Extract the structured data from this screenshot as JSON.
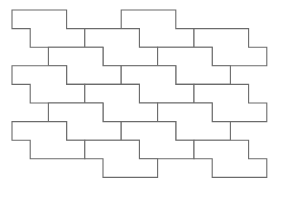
{
  "diagram": {
    "type": "polyomino-tiling",
    "colors": {
      "background": "#ffffff",
      "stroke": "#6b6b6b"
    },
    "grid": {
      "origin_x": 12,
      "origin_y": 10,
      "step_x": 18.2,
      "step_y": 18.6
    },
    "tile_shape_cells": [
      [
        0,
        0
      ],
      [
        1,
        0
      ],
      [
        2,
        0
      ],
      [
        1,
        1
      ],
      [
        2,
        1
      ],
      [
        3,
        1
      ]
    ],
    "tile_outline": [
      [
        0,
        0
      ],
      [
        3,
        0
      ],
      [
        3,
        1
      ],
      [
        4,
        1
      ],
      [
        4,
        2
      ],
      [
        1,
        2
      ],
      [
        1,
        1
      ],
      [
        0,
        1
      ]
    ],
    "lattice_vectors": [
      [
        4,
        1
      ],
      [
        6,
        0
      ]
    ],
    "tile_origins": [
      [
        0,
        0
      ],
      [
        6,
        0
      ],
      [
        4,
        1
      ],
      [
        10,
        1
      ],
      [
        2,
        2
      ],
      [
        8,
        2
      ],
      [
        0,
        3
      ],
      [
        6,
        3
      ],
      [
        4,
        4
      ],
      [
        10,
        4
      ],
      [
        2,
        5
      ],
      [
        8,
        5
      ],
      [
        0,
        6
      ],
      [
        6,
        6
      ],
      [
        4,
        7
      ],
      [
        10,
        7
      ]
    ]
  }
}
